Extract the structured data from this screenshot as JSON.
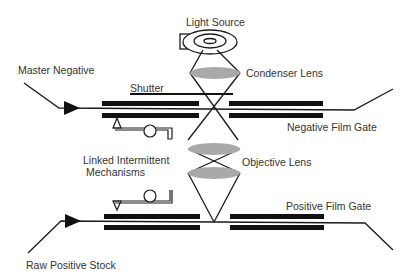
{
  "diagram": {
    "type": "optical film printer schematic",
    "labels": {
      "light_source": "Light Source",
      "master_negative": "Master Negative",
      "shutter": "Shutter",
      "condenser_lens": "Condenser Lens",
      "negative_film_gate": "Negative Film Gate",
      "linked_intermittent_line1": "Linked Intermittent",
      "linked_intermittent_line2": "Mechanisms",
      "objective_lens": "Objective Lens",
      "positive_film_gate": "Positive Film Gate",
      "raw_positive_stock": "Raw Positive Stock"
    },
    "colors": {
      "line": "#1a1a1a",
      "gate_bar": "#111111",
      "lens_fill": "#a9a9a9",
      "text": "#333333",
      "background": "#ffffff"
    }
  }
}
